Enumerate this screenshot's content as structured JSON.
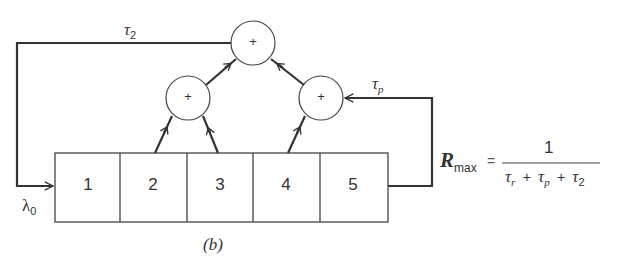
{
  "diagram": {
    "caption": "(b)",
    "stages": [
      {
        "label": "1"
      },
      {
        "label": "2"
      },
      {
        "label": "3"
      },
      {
        "label": "4"
      },
      {
        "label": "5"
      }
    ],
    "adders": [
      {
        "id": "adder-top",
        "symbol": "+"
      },
      {
        "id": "adder-left",
        "symbol": "+"
      },
      {
        "id": "adder-right",
        "symbol": "+"
      }
    ],
    "labels": {
      "tau2": {
        "base": "τ",
        "sub": "2"
      },
      "taup": {
        "base": "τ",
        "sub": "p"
      },
      "lambda0": {
        "base": "λ",
        "sub": "0"
      }
    },
    "formula": {
      "lhs_base": "R",
      "lhs_sub": "max",
      "equals": "=",
      "numerator": "1",
      "denominator": [
        {
          "base": "τ",
          "sub": "r"
        },
        {
          "op": "+"
        },
        {
          "base": "τ",
          "sub": "p"
        },
        {
          "op": "+"
        },
        {
          "base": "τ",
          "sub": "2"
        }
      ]
    },
    "connections": [
      {
        "from": "stage-2",
        "to": "adder-left"
      },
      {
        "from": "stage-3",
        "to": "adder-left"
      },
      {
        "from": "stage-4",
        "to": "adder-right"
      },
      {
        "from": "stage-5",
        "to": "adder-right",
        "label": "τp"
      },
      {
        "from": "adder-left",
        "to": "adder-top"
      },
      {
        "from": "adder-right",
        "to": "adder-top"
      },
      {
        "from": "adder-top",
        "to": "stage-1",
        "label": "τ2"
      }
    ]
  }
}
